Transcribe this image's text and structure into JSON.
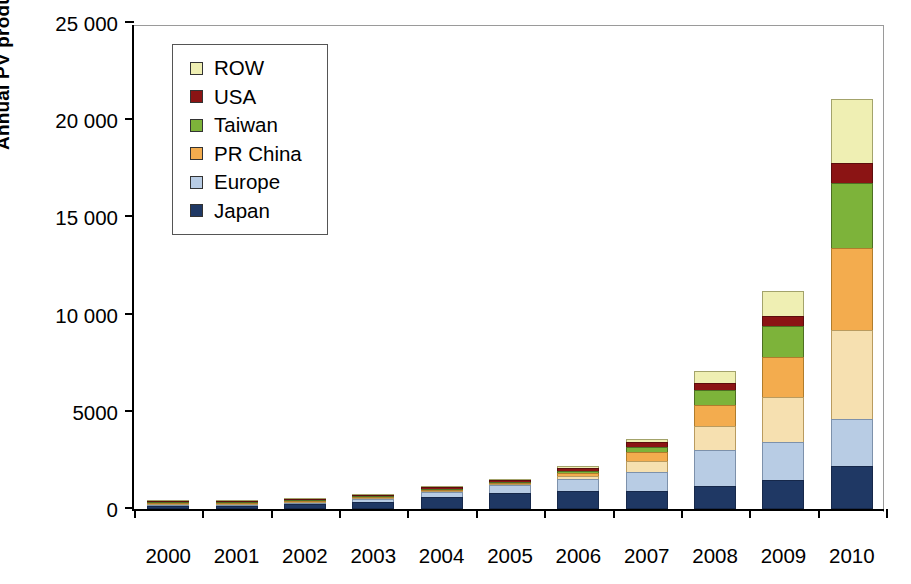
{
  "chart_data": {
    "type": "bar",
    "subtype": "stacked-vertical-bar",
    "title": "",
    "xlabel": "",
    "ylabel": "Annual PV production (MW)",
    "ylim": [
      0,
      25000
    ],
    "ytick_values": [
      0,
      5000,
      10000,
      15000,
      20000,
      25000
    ],
    "ytick_labels": [
      "0",
      "5000",
      "10 000",
      "15 000",
      "20 000",
      "25 000"
    ],
    "grid": false,
    "legend_position": "top-left inside plot",
    "categories": [
      "2000",
      "2001",
      "2002",
      "2003",
      "2004",
      "2005",
      "2006",
      "2007",
      "2008",
      "2009",
      "2010"
    ],
    "series": [
      {
        "name": "Japan",
        "color": "#1F3864",
        "values": [
          130,
          175,
          250,
          365,
          600,
          830,
          930,
          920,
          1200,
          1500,
          2200
        ]
      },
      {
        "name": "Europe",
        "color": "#B8CCE4",
        "values": [
          60,
          90,
          135,
          195,
          320,
          470,
          690,
          1060,
          1880,
          2000,
          2500
        ]
      },
      {
        "name": "PR China",
        "color": "#F3AC4E",
        "values": [
          20,
          30,
          50,
          70,
          100,
          200,
          380,
          1100,
          2450,
          4500,
          8900
        ]
      },
      {
        "name": "Taiwan",
        "color": "#7DB33A",
        "values": [
          5,
          8,
          12,
          20,
          35,
          75,
          150,
          340,
          800,
          1600,
          3400
        ]
      },
      {
        "name": "USA",
        "color": "#8B1414",
        "values": [
          60,
          75,
          95,
          100,
          140,
          155,
          205,
          270,
          420,
          600,
          1050
        ]
      },
      {
        "name": "ROW",
        "color": "#EFEFB3",
        "values": [
          5,
          12,
          18,
          30,
          55,
          70,
          145,
          210,
          650,
          1300,
          3350
        ]
      }
    ],
    "totals": [
      280,
      390,
      560,
      780,
      1250,
      1800,
      2500,
      3900,
      7400,
      11500,
      21400
    ],
    "stack_order_bottom_to_top": [
      "Japan",
      "Europe",
      "PR China",
      "Taiwan",
      "USA",
      "ROW"
    ]
  },
  "legend": {
    "items": [
      {
        "label": "ROW",
        "color": "#EFEFB3"
      },
      {
        "label": "USA",
        "color": "#8B1414"
      },
      {
        "label": "Taiwan",
        "color": "#7DB33A"
      },
      {
        "label": "PR China",
        "color": "#F3AC4E"
      },
      {
        "label": "Europe",
        "color": "#B8CCE4"
      },
      {
        "label": "Japan",
        "color": "#1F3864"
      }
    ]
  }
}
